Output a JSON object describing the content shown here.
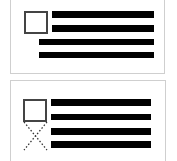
{
  "diagram": {
    "panels": [
      {
        "name": "wrap-around-image",
        "image_placeholder": "square",
        "text_lines": 4,
        "wrap": "text flows under image"
      },
      {
        "name": "image-with-empty-space",
        "image_placeholder": "square",
        "text_lines": 4,
        "wrap": "text stays beside image; empty area below marked with dotted X"
      }
    ],
    "colors": {
      "line": "#000000",
      "border": "#cfcfcf",
      "square": "#444444"
    }
  }
}
